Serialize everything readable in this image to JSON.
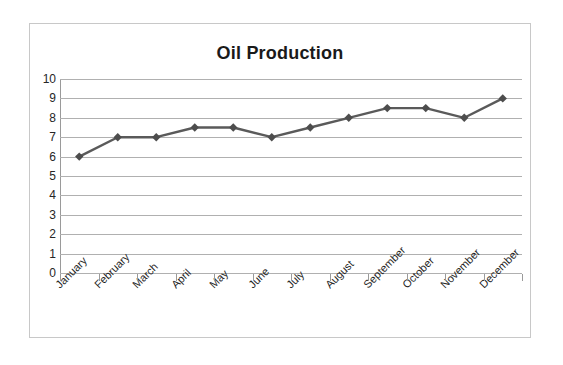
{
  "chart_data": {
    "type": "line",
    "title": "Oil Production",
    "xlabel": "",
    "ylabel": "",
    "categories": [
      "January",
      "February",
      "March",
      "April",
      "May",
      "June",
      "July",
      "August",
      "September",
      "October",
      "November",
      "December"
    ],
    "values": [
      6,
      7,
      7,
      7.5,
      7.5,
      7,
      7.5,
      8,
      8.5,
      8.5,
      8,
      9
    ],
    "series": [
      {
        "name": "Oil Production",
        "values": [
          6,
          7,
          7,
          7.5,
          7.5,
          7,
          7.5,
          8,
          8.5,
          8.5,
          8,
          9
        ]
      }
    ],
    "ylim": [
      0,
      10
    ],
    "ytick_labels": [
      "10",
      "9",
      "8",
      "7",
      "6",
      "5",
      "4",
      "3",
      "2",
      "1",
      "0"
    ],
    "ytick_values": [
      10,
      9,
      8,
      7,
      6,
      5,
      4,
      3,
      2,
      1,
      0
    ],
    "grid": true,
    "legend": false,
    "legend_position": "none",
    "marker": "diamond",
    "line_color": "#5a5a5a",
    "marker_color": "#4d4d4d",
    "gridline_color": "#b0b0b0",
    "border_color": "#c8c8c8",
    "plot_background": "#ffffff"
  }
}
